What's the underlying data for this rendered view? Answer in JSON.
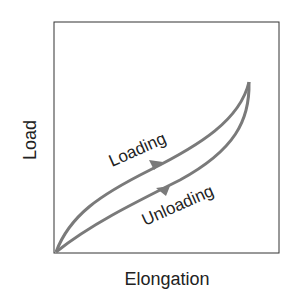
{
  "diagram": {
    "xlabel": "Elongation",
    "ylabel": "Load",
    "curves": [
      {
        "name": "Loading",
        "label": "Loading",
        "direction": "up"
      },
      {
        "name": "Unloading",
        "label": "Unloading",
        "direction": "down"
      }
    ],
    "colors": {
      "curve": "#7a7a7a",
      "axis": "#333333",
      "text": "#222222"
    }
  }
}
